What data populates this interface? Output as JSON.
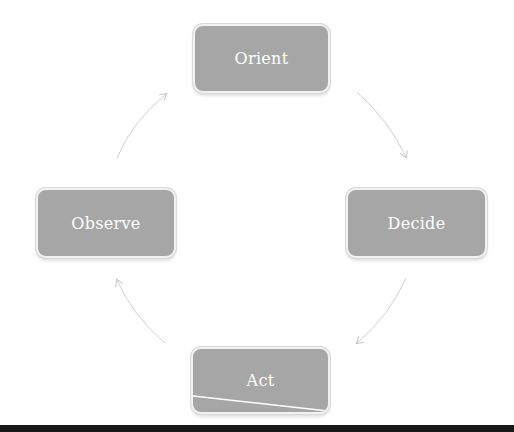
{
  "diagram": {
    "type": "cycle",
    "title": "",
    "nodes": [
      {
        "id": "orient",
        "label": "Orient",
        "position": "top"
      },
      {
        "id": "decide",
        "label": "Decide",
        "position": "right"
      },
      {
        "id": "act",
        "label": "Act",
        "position": "bottom"
      },
      {
        "id": "observe",
        "label": "Observe",
        "position": "left"
      }
    ],
    "edges": [
      {
        "from": "orient",
        "to": "decide",
        "direction": "clockwise"
      },
      {
        "from": "decide",
        "to": "act",
        "direction": "clockwise"
      },
      {
        "from": "act",
        "to": "observe",
        "direction": "clockwise"
      },
      {
        "from": "observe",
        "to": "orient",
        "direction": "clockwise"
      }
    ],
    "colors": {
      "node_fill": "#a6a6a6",
      "node_border": "#f2f2f2",
      "node_text": "#ffffff",
      "arrow": "#c8c8c8",
      "background": "#ffffff"
    }
  }
}
